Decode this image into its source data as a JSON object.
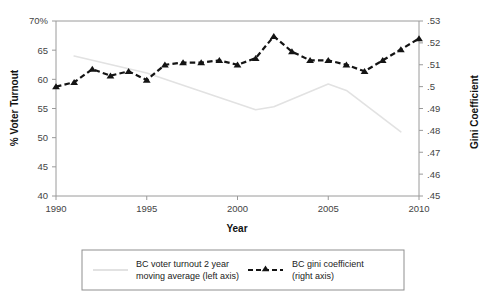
{
  "chart_data": {
    "type": "line",
    "title": "",
    "xlabel": "Year",
    "ylabel": "% Voter Turnout",
    "y2label": "Gini Coefficient",
    "grid": false,
    "legend_position": "bottom",
    "xlim": [
      1990,
      2010
    ],
    "ylim": [
      40,
      70
    ],
    "y2lim": [
      0.45,
      0.53
    ],
    "xticks": [
      1990,
      1995,
      2000,
      2005,
      2010
    ],
    "xtick_labels": [
      "1990",
      "1995",
      "2000",
      "2005",
      "2010"
    ],
    "yticks": [
      40,
      45,
      50,
      55,
      60,
      65,
      70
    ],
    "ytick_labels": [
      "40",
      "45",
      "50",
      "55",
      "60",
      "65",
      "70%"
    ],
    "y2ticks": [
      0.45,
      0.46,
      0.47,
      0.48,
      0.49,
      0.5,
      0.51,
      0.52,
      0.53
    ],
    "y2tick_labels": [
      ".45",
      ".46",
      ".47",
      ".48",
      ".49",
      ".5",
      ".51",
      ".52",
      ".53"
    ],
    "x": [
      1990,
      1991,
      1992,
      1993,
      1994,
      1995,
      1996,
      1997,
      1998,
      1999,
      2000,
      2001,
      2002,
      2003,
      2004,
      2005,
      2006,
      2007,
      2008,
      2009,
      2010
    ],
    "series": [
      {
        "name": "BC voter turnout 2 year moving average (left axis)",
        "axis": "left",
        "style": "solid",
        "color": "#e2e2e2",
        "x": [
          1991,
          1995,
          2001,
          2002,
          2005,
          2006,
          2009
        ],
        "values": [
          64.0,
          61.1,
          54.8,
          55.3,
          59.2,
          58.1,
          51.0
        ]
      },
      {
        "name": "BC gini coefficient (right axis)",
        "axis": "right",
        "style": "dashed",
        "color": "#141414",
        "marker": "triangle",
        "x": [
          1990,
          1991,
          1992,
          1993,
          1994,
          1995,
          1996,
          1997,
          1998,
          1999,
          2000,
          2001,
          2002,
          2003,
          2004,
          2005,
          2006,
          2007,
          2008,
          2009,
          2010
        ],
        "values": [
          0.5,
          0.502,
          0.508,
          0.505,
          0.507,
          0.503,
          0.51,
          0.511,
          0.511,
          0.512,
          0.51,
          0.513,
          0.523,
          0.516,
          0.512,
          0.512,
          0.51,
          0.507,
          0.512,
          0.517,
          0.522
        ]
      }
    ],
    "legend": [
      {
        "label_line1": "BC voter turnout 2 year",
        "label_line2": "moving average (left axis)",
        "swatch": "solid-gray-line"
      },
      {
        "label_line1": "BC gini coefficient",
        "label_line2": "(right axis)",
        "swatch": "dashed-black-line-triangle"
      }
    ]
  }
}
